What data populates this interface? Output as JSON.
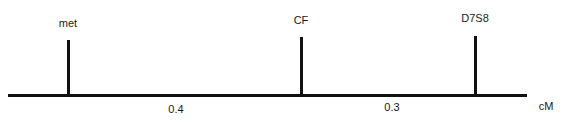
{
  "diagram": {
    "type": "genetic-linkage-map",
    "unit_label": "cM",
    "markers": [
      {
        "name": "met"
      },
      {
        "name": "CF"
      },
      {
        "name": "D7S8"
      }
    ],
    "intervals": [
      {
        "from": "met",
        "to": "CF",
        "distance": "0.4"
      },
      {
        "from": "CF",
        "to": "D7S8",
        "distance": "0.3"
      }
    ]
  }
}
